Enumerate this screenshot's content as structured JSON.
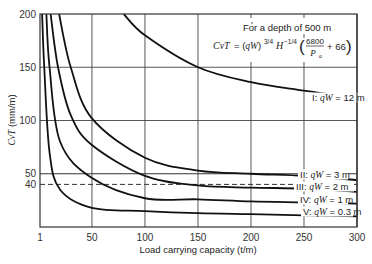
{
  "chart_data": {
    "type": "line",
    "title": "",
    "annotation": {
      "line1": "For a depth of 500 m",
      "formula_lhs": "CvT",
      "formula_rhs": "= (qW)^{3/4} H^{-1/4} (6800/P_a + 66)",
      "f_cvt": "CvT",
      "f_eq": " = (qW)",
      "f_exp1": "3/4",
      "f_H": "H",
      "f_exp2": "−1/4",
      "f_num": "6800",
      "f_den": "P",
      "f_den_sub": "a",
      "f_plus": "+ 66"
    },
    "xlabel": "Load carrying capacity (t/m)",
    "ylabel": "CvT (mm/m)",
    "ylabel_italic": "CvT",
    "ylabel_unit": " (mm/m)",
    "xlim": [
      1,
      300
    ],
    "ylim": [
      0,
      200
    ],
    "x_ticks": [
      "1",
      "50",
      "100",
      "150",
      "200",
      "250",
      "300"
    ],
    "y_ticks": [
      "50",
      "40",
      "100",
      "150",
      "200"
    ],
    "grid": true,
    "reference_lines": [
      {
        "y": 50,
        "style": "solid"
      },
      {
        "y": 40,
        "style": "dashed"
      }
    ],
    "series": [
      {
        "name": "I: qW = 12 m",
        "label_num": "I:",
        "qW": "qW = 12 m",
        "x": [
          80,
          100,
          150,
          200,
          250,
          300
        ],
        "values": [
          200,
          180,
          150,
          136,
          128,
          121
        ]
      },
      {
        "name": "II: qW = 3 m",
        "label_num": "II:",
        "qW": "qW = 3 m",
        "x": [
          19,
          30,
          50,
          100,
          150,
          200,
          250,
          300
        ],
        "values": [
          200,
          150,
          102,
          65,
          53,
          50,
          48,
          44
        ]
      },
      {
        "name": "III: qW = 2 m",
        "label_num": "III:",
        "qW": "qW = 2 m",
        "x": [
          11,
          18,
          30,
          50,
          100,
          150,
          200,
          250,
          300
        ],
        "values": [
          200,
          150,
          105,
          77,
          48,
          39,
          37,
          36,
          33
        ]
      },
      {
        "name": "IV: qW = 1 m",
        "label_num": "IV:",
        "qW": "qW = 1 m",
        "x": [
          7,
          10,
          20,
          50,
          100,
          150,
          200,
          250,
          300
        ],
        "values": [
          200,
          150,
          80,
          46,
          27,
          26,
          24,
          23,
          22
        ]
      },
      {
        "name": "V: qW = 0.3 m",
        "label_num": "V:",
        "qW": "qW = 0.3 m",
        "x": [
          3,
          5,
          10,
          20,
          50,
          100,
          150,
          200,
          250,
          300
        ],
        "values": [
          200,
          150,
          70,
          35,
          18,
          15,
          13,
          12,
          11,
          10
        ]
      }
    ]
  }
}
